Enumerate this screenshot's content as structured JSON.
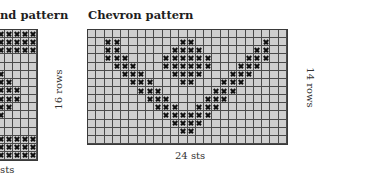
{
  "left_panel": {
    "title": "nd pattern",
    "rows_label": "16 rows",
    "sts_label": "sts",
    "visible_cols": 5,
    "rows": 16,
    "x_cells": [
      [
        0,
        0
      ],
      [
        0,
        1
      ],
      [
        0,
        2
      ],
      [
        0,
        3
      ],
      [
        0,
        4
      ],
      [
        1,
        0
      ],
      [
        1,
        1
      ],
      [
        1,
        2
      ],
      [
        1,
        3
      ],
      [
        1,
        4
      ],
      [
        2,
        0
      ],
      [
        2,
        1
      ],
      [
        2,
        2
      ],
      [
        2,
        3
      ],
      [
        2,
        4
      ],
      [
        5,
        0
      ],
      [
        6,
        0
      ],
      [
        6,
        1
      ],
      [
        7,
        0
      ],
      [
        7,
        1
      ],
      [
        7,
        2
      ],
      [
        8,
        0
      ],
      [
        8,
        1
      ],
      [
        8,
        2
      ],
      [
        9,
        0
      ],
      [
        9,
        1
      ],
      [
        10,
        0
      ],
      [
        13,
        0
      ],
      [
        13,
        1
      ],
      [
        13,
        2
      ],
      [
        13,
        3
      ],
      [
        13,
        4
      ],
      [
        14,
        0
      ],
      [
        14,
        1
      ],
      [
        14,
        2
      ],
      [
        14,
        3
      ],
      [
        14,
        4
      ],
      [
        15,
        0
      ],
      [
        15,
        1
      ],
      [
        15,
        2
      ],
      [
        15,
        3
      ],
      [
        15,
        4
      ]
    ]
  },
  "right_panel": {
    "title": "Chevron pattern",
    "rows_label": "14 rows",
    "sts_label": "24 sts",
    "cols": 24,
    "rows": 14,
    "x_cells": [
      [
        1,
        2
      ],
      [
        1,
        3
      ],
      [
        1,
        11
      ],
      [
        1,
        12
      ],
      [
        1,
        21
      ],
      [
        2,
        2
      ],
      [
        2,
        3
      ],
      [
        2,
        10
      ],
      [
        2,
        11
      ],
      [
        2,
        12
      ],
      [
        2,
        13
      ],
      [
        2,
        20
      ],
      [
        2,
        21
      ],
      [
        3,
        2
      ],
      [
        3,
        3
      ],
      [
        3,
        4
      ],
      [
        3,
        9
      ],
      [
        3,
        10
      ],
      [
        3,
        11
      ],
      [
        3,
        12
      ],
      [
        3,
        13
      ],
      [
        3,
        14
      ],
      [
        3,
        19
      ],
      [
        3,
        20
      ],
      [
        3,
        21
      ],
      [
        4,
        3
      ],
      [
        4,
        4
      ],
      [
        4,
        5
      ],
      [
        4,
        9
      ],
      [
        4,
        10
      ],
      [
        4,
        11
      ],
      [
        4,
        12
      ],
      [
        4,
        13
      ],
      [
        4,
        14
      ],
      [
        4,
        18
      ],
      [
        4,
        19
      ],
      [
        4,
        20
      ],
      [
        5,
        4
      ],
      [
        5,
        5
      ],
      [
        5,
        6
      ],
      [
        5,
        10
      ],
      [
        5,
        11
      ],
      [
        5,
        12
      ],
      [
        5,
        13
      ],
      [
        5,
        17
      ],
      [
        5,
        18
      ],
      [
        5,
        19
      ],
      [
        6,
        5
      ],
      [
        6,
        6
      ],
      [
        6,
        7
      ],
      [
        6,
        11
      ],
      [
        6,
        12
      ],
      [
        6,
        16
      ],
      [
        6,
        17
      ],
      [
        6,
        18
      ],
      [
        7,
        6
      ],
      [
        7,
        7
      ],
      [
        7,
        8
      ],
      [
        7,
        15
      ],
      [
        7,
        16
      ],
      [
        7,
        17
      ],
      [
        8,
        7
      ],
      [
        8,
        8
      ],
      [
        8,
        9
      ],
      [
        8,
        14
      ],
      [
        8,
        15
      ],
      [
        8,
        16
      ],
      [
        9,
        8
      ],
      [
        9,
        9
      ],
      [
        9,
        10
      ],
      [
        9,
        13
      ],
      [
        9,
        14
      ],
      [
        9,
        15
      ],
      [
        10,
        9
      ],
      [
        10,
        10
      ],
      [
        10,
        11
      ],
      [
        10,
        12
      ],
      [
        10,
        13
      ],
      [
        10,
        14
      ],
      [
        11,
        10
      ],
      [
        11,
        11
      ],
      [
        11,
        12
      ],
      [
        11,
        13
      ],
      [
        12,
        11
      ],
      [
        12,
        12
      ]
    ]
  },
  "colors": {
    "cell_fill": "#cfcfcf",
    "grid_line": "#4a4a4a",
    "mark": "#111111"
  }
}
